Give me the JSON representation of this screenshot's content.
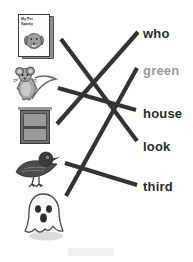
{
  "worksheet": {
    "type": "picture-word-matching",
    "instruction_visible": false,
    "stroke_color": "#333333",
    "word_color": "#2b2b2b",
    "word_muted_color": "#9a9a9a",
    "background": "#ffffff"
  },
  "pictures": [
    {
      "id": "book",
      "name": "book-picture",
      "alt": "book titled My Pet Sparky with a dog on the cover",
      "x": 18,
      "y": 14
    },
    {
      "id": "mouse",
      "name": "mouse-picture",
      "alt": "gray mouse standing upright",
      "x": 12,
      "y": 66
    },
    {
      "id": "window",
      "name": "window-picture",
      "alt": "house window with two panes",
      "x": 20,
      "y": 110
    },
    {
      "id": "bird",
      "name": "bird-picture",
      "alt": "dark bird perched",
      "x": 12,
      "y": 150
    },
    {
      "id": "ghost",
      "name": "ghost-picture",
      "alt": "white cartoon ghost",
      "x": 20,
      "y": 190
    }
  ],
  "book_cover": {
    "title_line1": "My Pet",
    "title_line2": "Sparky"
  },
  "words": [
    {
      "id": "who",
      "label": "who",
      "x": 143,
      "y": 27,
      "muted": false
    },
    {
      "id": "green",
      "label": "green",
      "x": 143,
      "y": 64,
      "muted": true
    },
    {
      "id": "house",
      "label": "house",
      "x": 143,
      "y": 107,
      "muted": false
    },
    {
      "id": "look",
      "label": "look",
      "x": 143,
      "y": 140,
      "muted": false
    },
    {
      "id": "third",
      "label": "third",
      "x": 143,
      "y": 180,
      "muted": false
    }
  ],
  "connections": [
    {
      "id": "book-to-look",
      "from": "book",
      "to": "look",
      "x1": 61,
      "y1": 39,
      "x2": 137,
      "y2": 141
    },
    {
      "id": "mouse-to-house",
      "from": "mouse",
      "to": "house",
      "x1": 58,
      "y1": 88,
      "x2": 136,
      "y2": 110
    },
    {
      "id": "window-to-who",
      "from": "window",
      "to": "who",
      "x1": 57,
      "y1": 124,
      "x2": 138,
      "y2": 32
    },
    {
      "id": "bird-to-third",
      "from": "bird",
      "to": "third",
      "x1": 65,
      "y1": 163,
      "x2": 137,
      "y2": 185
    },
    {
      "id": "ghost-to-green",
      "from": "ghost",
      "to": "green",
      "x1": 66,
      "y1": 196,
      "x2": 137,
      "y2": 68
    }
  ]
}
